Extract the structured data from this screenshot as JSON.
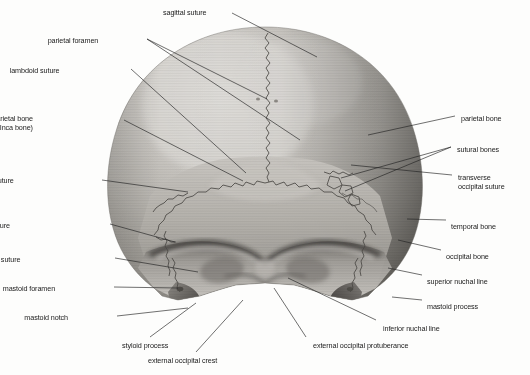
{
  "figure": {
    "style": "grayscale halftone anatomical photograph",
    "background_color": "#fdfdfc",
    "ink_color": "#1b1b1b",
    "bone_light": "#d8d6d2",
    "bone_mid": "#b3b0ab",
    "bone_dark": "#7d7a75",
    "bone_shadow": "#4a4845"
  },
  "labels": [
    {
      "id": "sagittal-suture",
      "text": "sagittal suture",
      "align": "left",
      "x": 163,
      "y": 8,
      "lines": [
        "sagittal suture"
      ]
    },
    {
      "id": "parietal-foramen",
      "text": "parietal foramen",
      "align": "right",
      "x": 98,
      "y": 36,
      "lines": [
        "parietal foramen"
      ]
    },
    {
      "id": "lambdoid-suture",
      "text": "lambdoid suture",
      "align": "right",
      "x": 60,
      "y": 66,
      "lines": [
        "lambdoid suture"
      ]
    },
    {
      "id": "interparietal-bone",
      "text": "interparietal bone (Inca bone)",
      "align": "right",
      "x": 33,
      "y": 114,
      "lines": [
        "interparietal bone",
        "(Inca bone)"
      ]
    },
    {
      "id": "squamous-suture",
      "text": "squamous suture",
      "align": "right",
      "x": 14,
      "y": 176,
      "lines": [
        "squamous suture"
      ]
    },
    {
      "id": "parietomastoid-suture",
      "text": "parietomastoid suture",
      "align": "right",
      "x": 10,
      "y": 221,
      "lines": [
        "parietomastoid suture"
      ]
    },
    {
      "id": "occipitomastoid-suture",
      "text": "occipitomastoid suture",
      "align": "right",
      "x": 20,
      "y": 255,
      "lines": [
        "occipitomastoid suture"
      ]
    },
    {
      "id": "mastoid-foramen",
      "text": "mastoid foramen",
      "align": "right",
      "x": 55,
      "y": 284,
      "lines": [
        "mastoid foramen"
      ]
    },
    {
      "id": "mastoid-notch",
      "text": "mastoid notch",
      "align": "right",
      "x": 68,
      "y": 313,
      "lines": [
        "mastoid notch"
      ]
    },
    {
      "id": "styloid-process",
      "text": "styloid process",
      "align": "left",
      "x": 122,
      "y": 341,
      "lines": [
        "styloid process"
      ]
    },
    {
      "id": "external-occipital-crest",
      "text": "external occipital crest",
      "align": "left",
      "x": 148,
      "y": 356,
      "lines": [
        "external occipital crest"
      ]
    },
    {
      "id": "external-occipital-protuberance",
      "text": "external occipital protuberance",
      "align": "left",
      "x": 313,
      "y": 341,
      "lines": [
        "external occipital protuberance"
      ]
    },
    {
      "id": "inferior-nuchal-line",
      "text": "inferior nuchal line",
      "align": "left",
      "x": 383,
      "y": 324,
      "lines": [
        "inferior nuchal line"
      ]
    },
    {
      "id": "mastoid-process",
      "text": "mastoid process",
      "align": "left",
      "x": 427,
      "y": 302,
      "lines": [
        "mastoid process"
      ]
    },
    {
      "id": "superior-nuchal-line",
      "text": "superior nuchal line",
      "align": "left",
      "x": 427,
      "y": 277,
      "lines": [
        "superior nuchal line"
      ]
    },
    {
      "id": "occipital-bone",
      "text": "occipital bone",
      "align": "left",
      "x": 446,
      "y": 252,
      "lines": [
        "occipital bone"
      ]
    },
    {
      "id": "temporal-bone",
      "text": "temporal bone",
      "align": "left",
      "x": 451,
      "y": 222,
      "lines": [
        "temporal bone"
      ]
    },
    {
      "id": "transverse-occipital-suture",
      "text": "transverse occipital suture",
      "align": "left",
      "x": 458,
      "y": 173,
      "lines": [
        "transverse",
        "occipital suture"
      ]
    },
    {
      "id": "sutural-bones",
      "text": "sutural bones",
      "align": "left",
      "x": 457,
      "y": 145,
      "lines": [
        "sutural bones"
      ]
    },
    {
      "id": "parietal-bone",
      "text": "parietal bone",
      "align": "left",
      "x": 461,
      "y": 114,
      "lines": [
        "parietal bone"
      ]
    }
  ],
  "leaders": [
    {
      "id": "leader-sagittal-suture",
      "from": [
        232,
        13
      ],
      "to": [
        317,
        57
      ]
    },
    {
      "id": "leader-parietal-foramen-a",
      "from": [
        147,
        39
      ],
      "to": [
        267,
        99
      ]
    },
    {
      "id": "leader-parietal-foramen-b",
      "from": [
        147,
        39
      ],
      "to": [
        300,
        140
      ]
    },
    {
      "id": "leader-lambdoid-suture",
      "from": [
        131,
        69
      ],
      "to": [
        246,
        173
      ]
    },
    {
      "id": "leader-interparietal-bone",
      "from": [
        124,
        120
      ],
      "to": [
        243,
        181
      ]
    },
    {
      "id": "leader-squamous-suture",
      "from": [
        102,
        180
      ],
      "to": [
        188,
        192
      ]
    },
    {
      "id": "leader-parietomastoid-suture",
      "from": [
        110,
        224
      ],
      "to": [
        175,
        242
      ]
    },
    {
      "id": "leader-occipitomastoid-suture",
      "from": [
        115,
        258
      ],
      "to": [
        198,
        272
      ]
    },
    {
      "id": "leader-mastoid-foramen",
      "from": [
        114,
        287
      ],
      "to": [
        178,
        288
      ]
    },
    {
      "id": "leader-mastoid-notch",
      "from": [
        117,
        316
      ],
      "to": [
        188,
        308
      ]
    },
    {
      "id": "leader-styloid-process",
      "from": [
        150,
        337
      ],
      "to": [
        196,
        303
      ]
    },
    {
      "id": "leader-external-occipital-crest",
      "from": [
        196,
        352
      ],
      "to": [
        243,
        300
      ]
    },
    {
      "id": "leader-external-occipital-protuberance",
      "from": [
        306,
        337
      ],
      "to": [
        274,
        288
      ]
    },
    {
      "id": "leader-inferior-nuchal-line",
      "from": [
        376,
        320
      ],
      "to": [
        288,
        278
      ]
    },
    {
      "id": "leader-mastoid-process",
      "from": [
        422,
        300
      ],
      "to": [
        392,
        297
      ]
    },
    {
      "id": "leader-superior-nuchal-line",
      "from": [
        422,
        275
      ],
      "to": [
        388,
        268
      ]
    },
    {
      "id": "leader-occipital-bone",
      "from": [
        441,
        250
      ],
      "to": [
        398,
        240
      ]
    },
    {
      "id": "leader-temporal-bone",
      "from": [
        446,
        220
      ],
      "to": [
        407,
        219
      ]
    },
    {
      "id": "leader-transverse-occipital-suture",
      "from": [
        452,
        175
      ],
      "to": [
        351,
        165
      ]
    },
    {
      "id": "leader-sutural-bones-a",
      "from": [
        451,
        147
      ],
      "to": [
        341,
        178
      ]
    },
    {
      "id": "leader-sutural-bones-b",
      "from": [
        451,
        147
      ],
      "to": [
        345,
        191
      ]
    },
    {
      "id": "leader-parietal-bone",
      "from": [
        455,
        116
      ],
      "to": [
        368,
        135
      ]
    }
  ]
}
